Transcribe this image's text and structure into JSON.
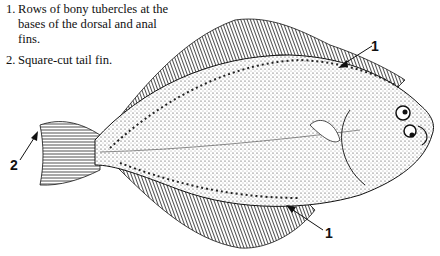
{
  "notes": [
    {
      "number": "1.",
      "text": "Rows of bony tubercles at the bases of the dorsal and anal fins."
    },
    {
      "number": "2.",
      "text": "Square-cut tail fin."
    }
  ],
  "callouts": [
    {
      "label": "1",
      "target": "dorsal fin base tubercles"
    },
    {
      "label": "2",
      "target": "tail fin"
    },
    {
      "label": "1",
      "target": "anal fin base tubercles"
    }
  ]
}
